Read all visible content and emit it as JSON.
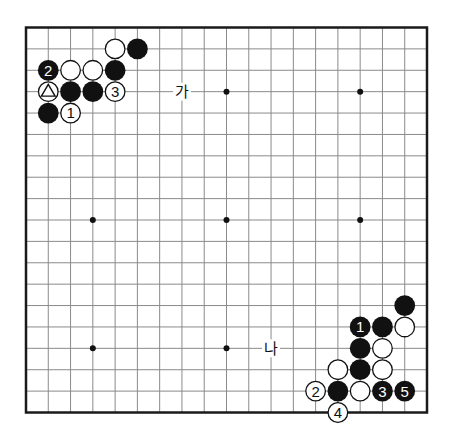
{
  "diagram": {
    "type": "go-board",
    "size": 19,
    "colors": {
      "background": "#ffffff",
      "grid_line": "#8a8a8a",
      "border": "#1a1a1a",
      "black_stone": "#111111",
      "white_stone": "#ffffff",
      "stone_outline": "#111111",
      "star_point": "#111111"
    },
    "star_points": [
      [
        3,
        3
      ],
      [
        9,
        3
      ],
      [
        15,
        3
      ],
      [
        3,
        9
      ],
      [
        9,
        9
      ],
      [
        15,
        9
      ],
      [
        3,
        15
      ],
      [
        9,
        15
      ],
      [
        15,
        15
      ]
    ],
    "stones": [
      {
        "col": 4,
        "row": 1,
        "color": "white",
        "label": ""
      },
      {
        "col": 5,
        "row": 1,
        "color": "black",
        "label": ""
      },
      {
        "col": 1,
        "row": 2,
        "color": "black",
        "label": "2"
      },
      {
        "col": 2,
        "row": 2,
        "color": "white",
        "label": ""
      },
      {
        "col": 3,
        "row": 2,
        "color": "white",
        "label": ""
      },
      {
        "col": 4,
        "row": 2,
        "color": "black",
        "label": ""
      },
      {
        "col": 1,
        "row": 3,
        "color": "white",
        "label": "△",
        "marker": "triangle"
      },
      {
        "col": 2,
        "row": 3,
        "color": "black",
        "label": ""
      },
      {
        "col": 3,
        "row": 3,
        "color": "black",
        "label": ""
      },
      {
        "col": 4,
        "row": 3,
        "color": "white",
        "label": "3"
      },
      {
        "col": 1,
        "row": 4,
        "color": "black",
        "label": ""
      },
      {
        "col": 2,
        "row": 4,
        "color": "white",
        "label": "1"
      },
      {
        "col": 17,
        "row": 13,
        "color": "black",
        "label": ""
      },
      {
        "col": 15,
        "row": 14,
        "color": "black",
        "label": "1"
      },
      {
        "col": 16,
        "row": 14,
        "color": "black",
        "label": ""
      },
      {
        "col": 17,
        "row": 14,
        "color": "white",
        "label": ""
      },
      {
        "col": 15,
        "row": 15,
        "color": "black",
        "label": ""
      },
      {
        "col": 16,
        "row": 15,
        "color": "white",
        "label": ""
      },
      {
        "col": 14,
        "row": 16,
        "color": "white",
        "label": ""
      },
      {
        "col": 15,
        "row": 16,
        "color": "black",
        "label": ""
      },
      {
        "col": 16,
        "row": 16,
        "color": "white",
        "label": ""
      },
      {
        "col": 13,
        "row": 17,
        "color": "white",
        "label": "2"
      },
      {
        "col": 14,
        "row": 17,
        "color": "black",
        "label": ""
      },
      {
        "col": 15,
        "row": 17,
        "color": "white",
        "label": ""
      },
      {
        "col": 16,
        "row": 17,
        "color": "black",
        "label": "3"
      },
      {
        "col": 17,
        "row": 17,
        "color": "black",
        "label": "5"
      },
      {
        "col": 14,
        "row": 18,
        "color": "white",
        "label": "4"
      }
    ],
    "point_labels": [
      {
        "col": 7,
        "row": 3,
        "text": "가",
        "name": "point-label-ga"
      },
      {
        "col": 11,
        "row": 15,
        "text": "나",
        "name": "point-label-na"
      }
    ]
  }
}
